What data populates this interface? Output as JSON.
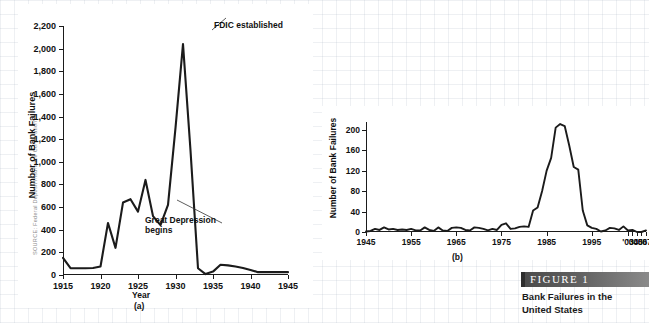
{
  "source_credit": "SOURCE: Federal Deposit Insurance Corporation",
  "figure": {
    "bar_label": "FIGURE   1",
    "caption_line1": "Bank Failures in the",
    "caption_line2": "United States"
  },
  "chart_data": [
    {
      "id": "panel-a",
      "type": "line",
      "title": "",
      "panel_letter": "(a)",
      "xlabel": "Year",
      "ylabel": "Number of Bank Failures",
      "xlim": [
        1915,
        1945
      ],
      "ylim": [
        0,
        2200
      ],
      "ytick_step": 200,
      "grid": false,
      "legend": "none",
      "xticks": [
        1915,
        1920,
        1925,
        1930,
        1935,
        1940,
        1945
      ],
      "xtick_labels": [
        "1915",
        "1920",
        "1925",
        "1930",
        "1935",
        "1940",
        "1945"
      ],
      "yticks": [
        0,
        200,
        400,
        600,
        800,
        1000,
        1200,
        1400,
        1600,
        1800,
        2000,
        2200
      ],
      "ytick_labels": [
        "0",
        "200",
        "400",
        "600",
        "800",
        "1,000",
        "1,200",
        "1,400",
        "1,600",
        "1,800",
        "2,000",
        "2,200"
      ],
      "x": [
        1915,
        1916,
        1917,
        1918,
        1919,
        1920,
        1921,
        1922,
        1923,
        1924,
        1925,
        1926,
        1927,
        1928,
        1929,
        1930,
        1931,
        1932,
        1933,
        1934,
        1935,
        1936,
        1937,
        1938,
        1939,
        1940,
        1941,
        1942,
        1943,
        1944,
        1945
      ],
      "values": [
        152,
        60,
        60,
        60,
        62,
        75,
        460,
        240,
        640,
        670,
        560,
        840,
        520,
        440,
        620,
        1300,
        2040,
        1100,
        60,
        8,
        30,
        90,
        85,
        75,
        62,
        45,
        25,
        25,
        25,
        25,
        25
      ],
      "annotations": [
        {
          "text": "FDIC established",
          "x": 1933,
          "y": 2040
        },
        {
          "text": "Great Depression\nbegins",
          "x": 1929,
          "y": 660
        }
      ]
    },
    {
      "id": "panel-b",
      "type": "line",
      "title": "",
      "panel_letter": "(b)",
      "xlabel": "",
      "ylabel": "Number of Bank Failures",
      "xlim": [
        1945,
        2007
      ],
      "ylim": [
        0,
        215
      ],
      "ytick_step": 40,
      "grid": false,
      "legend": "none",
      "xticks": [
        1945,
        1955,
        1965,
        1975,
        1985,
        1995,
        2003,
        2004,
        2005,
        2006,
        2007
      ],
      "xtick_labels": [
        "1945",
        "1955",
        "1965",
        "1975",
        "1985",
        "1995",
        "'03",
        "'04",
        "'05",
        "'06",
        "'07"
      ],
      "yticks": [
        0,
        40,
        80,
        120,
        160,
        200
      ],
      "ytick_labels": [
        "0",
        "40",
        "80",
        "120",
        "160",
        "200"
      ],
      "x": [
        1945,
        1946,
        1947,
        1948,
        1949,
        1950,
        1951,
        1952,
        1953,
        1954,
        1955,
        1956,
        1957,
        1958,
        1959,
        1960,
        1961,
        1962,
        1963,
        1964,
        1965,
        1966,
        1967,
        1968,
        1969,
        1970,
        1971,
        1972,
        1973,
        1974,
        1975,
        1976,
        1977,
        1978,
        1979,
        1980,
        1981,
        1982,
        1983,
        1984,
        1985,
        1986,
        1987,
        1988,
        1989,
        1990,
        1991,
        1992,
        1993,
        1994,
        1995,
        1996,
        1997,
        1998,
        1999,
        2000,
        2001,
        2002,
        2003,
        2004,
        2005,
        2006,
        2007
      ],
      "values": [
        1,
        2,
        6,
        4,
        9,
        5,
        6,
        4,
        5,
        4,
        6,
        3,
        3,
        9,
        4,
        2,
        9,
        3,
        2,
        8,
        9,
        8,
        4,
        3,
        9,
        8,
        6,
        3,
        6,
        4,
        14,
        17,
        6,
        7,
        10,
        11,
        10,
        42,
        48,
        80,
        120,
        145,
        204,
        211,
        207,
        169,
        127,
        122,
        42,
        13,
        8,
        6,
        1,
        3,
        8,
        7,
        4,
        11,
        3,
        4,
        0,
        0,
        3
      ]
    }
  ]
}
